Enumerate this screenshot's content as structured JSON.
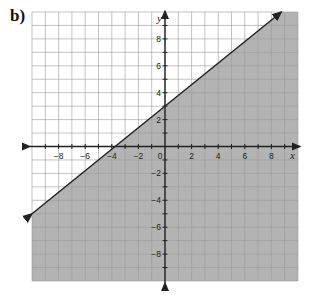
{
  "label": "b)",
  "chart_data": {
    "type": "line",
    "title": "",
    "xlabel": "x",
    "ylabel": "y",
    "xlim": [
      -10,
      10
    ],
    "ylim": [
      -10,
      10
    ],
    "grid": true,
    "x_tick_labels": [
      "−8",
      "−6",
      "−4",
      "−2",
      "0",
      "2",
      "4",
      "6",
      "8"
    ],
    "x_ticks": [
      -8,
      -6,
      -4,
      -2,
      0,
      2,
      4,
      6,
      8
    ],
    "y_tick_labels": [
      "8",
      "6",
      "4",
      "2",
      "−2",
      "−4",
      "−6",
      "−8"
    ],
    "y_ticks": [
      8,
      6,
      4,
      2,
      -2,
      -4,
      -6,
      -8
    ],
    "series": [
      {
        "name": "boundary line y = 0.8x + 3",
        "slope": 0.8,
        "intercept": 3,
        "x": [
          -10,
          8.75
        ],
        "y": [
          -5,
          10
        ],
        "style": "solid",
        "arrows": "both"
      }
    ],
    "shaded_region": "below line (y < 0.8x + 3)",
    "colors": {
      "shade": "#b3b3b3",
      "grid": "#9a9a9a",
      "line": "#222222"
    }
  }
}
